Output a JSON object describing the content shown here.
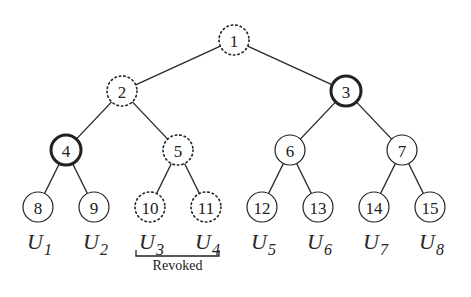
{
  "diagram": {
    "type": "binary-tree",
    "nodes": [
      {
        "id": "1",
        "label": "1",
        "x": 234,
        "y": 40,
        "style": "dotted"
      },
      {
        "id": "2",
        "label": "2",
        "x": 122,
        "y": 91,
        "style": "dotted"
      },
      {
        "id": "3",
        "label": "3",
        "x": 346,
        "y": 91,
        "style": "bold"
      },
      {
        "id": "4",
        "label": "4",
        "x": 66,
        "y": 150,
        "style": "bold"
      },
      {
        "id": "5",
        "label": "5",
        "x": 178,
        "y": 150,
        "style": "dotted"
      },
      {
        "id": "6",
        "label": "6",
        "x": 290,
        "y": 150,
        "style": "normal"
      },
      {
        "id": "7",
        "label": "7",
        "x": 402,
        "y": 150,
        "style": "normal"
      },
      {
        "id": "8",
        "label": "8",
        "x": 38,
        "y": 207,
        "style": "normal"
      },
      {
        "id": "9",
        "label": "9",
        "x": 94,
        "y": 207,
        "style": "normal"
      },
      {
        "id": "10",
        "label": "10",
        "x": 150,
        "y": 207,
        "style": "dotted"
      },
      {
        "id": "11",
        "label": "11",
        "x": 206,
        "y": 207,
        "style": "dotted"
      },
      {
        "id": "12",
        "label": "12",
        "x": 262,
        "y": 207,
        "style": "normal"
      },
      {
        "id": "13",
        "label": "13",
        "x": 318,
        "y": 207,
        "style": "normal"
      },
      {
        "id": "14",
        "label": "14",
        "x": 374,
        "y": 207,
        "style": "normal"
      },
      {
        "id": "15",
        "label": "15",
        "x": 430,
        "y": 207,
        "style": "normal"
      }
    ],
    "edges": [
      [
        "1",
        "2"
      ],
      [
        "1",
        "3"
      ],
      [
        "2",
        "4"
      ],
      [
        "2",
        "5"
      ],
      [
        "3",
        "6"
      ],
      [
        "3",
        "7"
      ],
      [
        "4",
        "8"
      ],
      [
        "4",
        "9"
      ],
      [
        "5",
        "10"
      ],
      [
        "5",
        "11"
      ],
      [
        "6",
        "12"
      ],
      [
        "6",
        "13"
      ],
      [
        "7",
        "14"
      ],
      [
        "7",
        "15"
      ]
    ],
    "users": [
      {
        "base": "U",
        "sub": "1",
        "x": 38
      },
      {
        "base": "U",
        "sub": "2",
        "x": 94
      },
      {
        "base": "U",
        "sub": "3",
        "x": 150
      },
      {
        "base": "U",
        "sub": "4",
        "x": 206
      },
      {
        "base": "U",
        "sub": "5",
        "x": 262
      },
      {
        "base": "U",
        "sub": "6",
        "x": 318
      },
      {
        "base": "U",
        "sub": "7",
        "x": 374
      },
      {
        "base": "U",
        "sub": "8",
        "x": 430
      }
    ],
    "bracket": {
      "label": "Revoked",
      "covers": [
        "U3",
        "U4"
      ],
      "x1": 136,
      "x2": 219,
      "y": 256
    }
  }
}
